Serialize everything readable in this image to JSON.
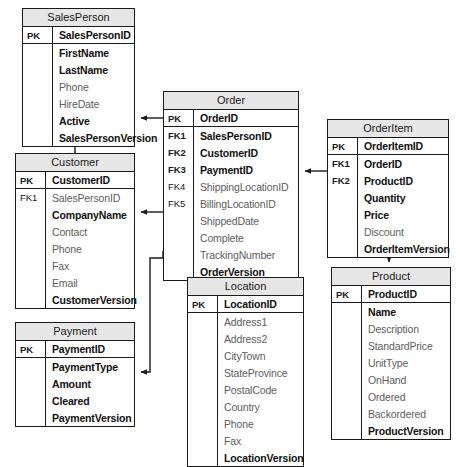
{
  "diagram": {
    "type": "er-diagram",
    "background_color": "#ffffff",
    "header_color": "#e7e7e7",
    "line_color": "#1a1a1a"
  },
  "entities": [
    {
      "id": "salesperson",
      "name": "SalesPerson",
      "x": 22,
      "y": 8,
      "width": 113,
      "fields": [
        {
          "key": "PK",
          "key_bold": true,
          "name": "SalesPersonID",
          "bold": true,
          "pk": true
        },
        {
          "key": "",
          "name": "FirstName",
          "bold": true
        },
        {
          "key": "",
          "name": "LastName",
          "bold": true
        },
        {
          "key": "",
          "name": "Phone",
          "bold": false
        },
        {
          "key": "",
          "name": "HireDate",
          "bold": false
        },
        {
          "key": "",
          "name": "Active",
          "bold": true
        },
        {
          "key": "",
          "name": "SalesPersonVersion",
          "bold": true
        }
      ]
    },
    {
      "id": "order",
      "name": "Order",
      "x": 163,
      "y": 91,
      "width": 136,
      "fields": [
        {
          "key": "PK",
          "key_bold": true,
          "name": "OrderID",
          "bold": true,
          "pk": true
        },
        {
          "key": "FK1",
          "key_bold": true,
          "name": "SalesPersonID",
          "bold": true
        },
        {
          "key": "FK2",
          "key_bold": true,
          "name": "CustomerID",
          "bold": true
        },
        {
          "key": "FK3",
          "key_bold": true,
          "name": "PaymentID",
          "bold": true
        },
        {
          "key": "FK4",
          "key_bold": false,
          "name": "ShippingLocationID",
          "bold": false
        },
        {
          "key": "FK5",
          "key_bold": false,
          "name": "BillingLocationID",
          "bold": false
        },
        {
          "key": "",
          "name": "ShippedDate",
          "bold": false
        },
        {
          "key": "",
          "name": "Complete",
          "bold": false
        },
        {
          "key": "",
          "name": "TrackingNumber",
          "bold": false
        },
        {
          "key": "",
          "name": "OrderVersion",
          "bold": true
        }
      ]
    },
    {
      "id": "orderitem",
      "name": "OrderItem",
      "x": 327,
      "y": 119,
      "width": 122,
      "fields": [
        {
          "key": "PK",
          "key_bold": true,
          "name": "OrderItemID",
          "bold": true,
          "pk": true
        },
        {
          "key": "FK1",
          "key_bold": true,
          "name": "OrderID",
          "bold": true
        },
        {
          "key": "FK2",
          "key_bold": true,
          "name": "ProductID",
          "bold": true
        },
        {
          "key": "",
          "name": "Quantity",
          "bold": true
        },
        {
          "key": "",
          "name": "Price",
          "bold": true
        },
        {
          "key": "",
          "name": "Discount",
          "bold": false
        },
        {
          "key": "",
          "name": "OrderItemVersion",
          "bold": true
        }
      ]
    },
    {
      "id": "customer",
      "name": "Customer",
      "x": 15,
      "y": 153,
      "width": 120,
      "fields": [
        {
          "key": "PK",
          "key_bold": true,
          "name": "CustomerID",
          "bold": true,
          "pk": true
        },
        {
          "key": "FK1",
          "key_bold": false,
          "name": "SalesPersonID",
          "bold": false
        },
        {
          "key": "",
          "name": "CompanyName",
          "bold": true
        },
        {
          "key": "",
          "name": "Contact",
          "bold": false
        },
        {
          "key": "",
          "name": "Phone",
          "bold": false
        },
        {
          "key": "",
          "name": "Fax",
          "bold": false
        },
        {
          "key": "",
          "name": "Email",
          "bold": false
        },
        {
          "key": "",
          "name": "CustomerVersion",
          "bold": true
        }
      ]
    },
    {
      "id": "product",
      "name": "Product",
      "x": 331,
      "y": 267,
      "width": 120,
      "fields": [
        {
          "key": "PK",
          "key_bold": true,
          "name": "ProductID",
          "bold": true,
          "pk": true
        },
        {
          "key": "",
          "name": "Name",
          "bold": true
        },
        {
          "key": "",
          "name": "Description",
          "bold": false
        },
        {
          "key": "",
          "name": "StandardPrice",
          "bold": false
        },
        {
          "key": "",
          "name": "UnitType",
          "bold": false
        },
        {
          "key": "",
          "name": "OnHand",
          "bold": false
        },
        {
          "key": "",
          "name": "Ordered",
          "bold": false
        },
        {
          "key": "",
          "name": "Backordered",
          "bold": false
        },
        {
          "key": "",
          "name": "ProductVersion",
          "bold": true
        }
      ]
    },
    {
      "id": "location",
      "name": "Location",
      "x": 187,
      "y": 277,
      "width": 117,
      "fields": [
        {
          "key": "PK",
          "key_bold": true,
          "name": "LocationID",
          "bold": true,
          "pk": true
        },
        {
          "key": "",
          "name": "Address1",
          "bold": false
        },
        {
          "key": "",
          "name": "Address2",
          "bold": false
        },
        {
          "key": "",
          "name": "CityTown",
          "bold": false
        },
        {
          "key": "",
          "name": "StateProvince",
          "bold": false
        },
        {
          "key": "",
          "name": "PostalCode",
          "bold": false
        },
        {
          "key": "",
          "name": "Country",
          "bold": false
        },
        {
          "key": "",
          "name": "Phone",
          "bold": false
        },
        {
          "key": "",
          "name": "Fax",
          "bold": false
        },
        {
          "key": "",
          "name": "LocationVersion",
          "bold": true
        }
      ]
    },
    {
      "id": "payment",
      "name": "Payment",
      "x": 15,
      "y": 322,
      "width": 120,
      "fields": [
        {
          "key": "PK",
          "key_bold": true,
          "name": "PaymentID",
          "bold": true,
          "pk": true
        },
        {
          "key": "",
          "name": "PaymentType",
          "bold": true
        },
        {
          "key": "",
          "name": "Amount",
          "bold": true
        },
        {
          "key": "",
          "name": "Cleared",
          "bold": true
        },
        {
          "key": "",
          "name": "PaymentVersion",
          "bold": true
        }
      ]
    }
  ],
  "relationships": [
    {
      "id": "order-salesperson",
      "from": "order",
      "to": "salesperson",
      "label": "Order.SalesPersonID to SalesPerson.SalesPersonID"
    },
    {
      "id": "order-customer",
      "from": "order",
      "to": "customer",
      "label": "Order.CustomerID to Customer.CustomerID"
    },
    {
      "id": "order-payment",
      "from": "order",
      "to": "payment",
      "label": "Order.PaymentID to Payment.PaymentID"
    },
    {
      "id": "order-location-shipping",
      "from": "order",
      "to": "location",
      "label": "Order.ShippingLocationID to Location.LocationID"
    },
    {
      "id": "order-location-billing",
      "from": "order",
      "to": "location",
      "label": "Order.BillingLocationID to Location.LocationID"
    },
    {
      "id": "customer-salesperson",
      "from": "customer",
      "to": "salesperson",
      "label": "Customer.SalesPersonID to SalesPerson.SalesPersonID"
    },
    {
      "id": "orderitem-order",
      "from": "orderitem",
      "to": "order",
      "label": "OrderItem.OrderID to Order.OrderID"
    },
    {
      "id": "orderitem-product",
      "from": "orderitem",
      "to": "product",
      "label": "OrderItem.ProductID to Product.ProductID"
    }
  ]
}
